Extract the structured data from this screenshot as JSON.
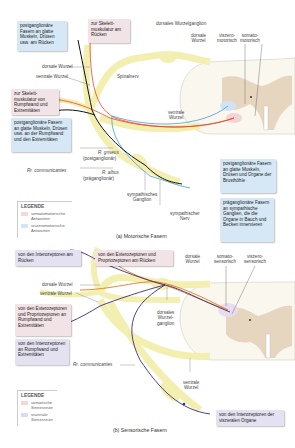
{
  "figure_a": {
    "caption": "(a) Motorische Fasern",
    "boxes": {
      "post_ruecken": "postganglionäre Fasern an glatte Muskeln, Drüsen usw. am Rücken",
      "skelett_ruecken": "zur Skelett-muskulatur am Rücken",
      "skelett_rumpf": "zur Skelett-muskulatur von Rumpfwand und Extremitäten",
      "post_rumpf": "postganglionäre Fasern an glatte Muskeln, Drüsen usw. an der Rumpfwand und den Extremitäten",
      "post_brust": "postganglionäre Fasern an glatte Muskeln, Drüsen und Organe der Brusthöhle",
      "prae_bauch": "präganglionäre Fasern an sympathische Ganglien, die die Organe in Bauch und Becken innervieren"
    },
    "labels": {
      "dorsales_ganglion": "dorsales Wurzelganglion",
      "dorsale_wurzel_top": "dorsale",
      "dorsale_wurzel_top2": "Wurzel",
      "viszero": "viszero-",
      "viszero2": "motorisch",
      "somato": "somato-",
      "somato2": "motorisch",
      "dorsale_wurzel": "dorsale Wurzel",
      "ventrale_wurzel": "ventrale Wurzel",
      "spinalnerv": "Spinalnerv",
      "ventrale_wurzel_r1": "ventrale",
      "ventrale_wurzel_r2": "Wurzel",
      "r_griseus": "R. griseus",
      "postganglionaer": "(postganglionär)",
      "r_albus": "R. albus",
      "praeganglionaer": "(präganglionär)",
      "rr_communicantes": "Rr. communicantes",
      "symp_ganglion1": "sympathisches",
      "symp_ganglion2": "Ganglion",
      "symp_nerv1": "sympathischer",
      "symp_nerv2": "Nerv"
    },
    "legend": {
      "title": "LEGENDE",
      "items": [
        {
          "label": "somatomotorische Antworten",
          "color": "#f4d7d9"
        },
        {
          "label": "viszeromotorische Antworten",
          "color": "#d3e6f4"
        }
      ]
    }
  },
  "figure_b": {
    "caption": "(b) Sensorische Fasern",
    "boxes": {
      "intero_ruecken": "von den Interozeptoren am Rücken",
      "extero_ruecken": "von den Exterozeptoren und Propriozeptoren am Rücken",
      "extero_rumpf": "von den Exterozeptoren und Propriozeptoren an Rumpfwand und Extremitäten",
      "intero_rumpf": "von den Interozeptoren an Rumpfwand und Extremitäten",
      "intero_organe": "von den Interozeptoren der viszeralen Organe"
    },
    "labels": {
      "dorsale_top1": "dorsale",
      "dorsale_top2": "Wurzel",
      "somato1": "somato-",
      "somato2": "sensorisch",
      "viszero1": "viszero-",
      "viszero2": "sensorisch",
      "dorsale_wurzel": "dorsale Wurzel",
      "ventrale_wurzel": "ventrale Wurzel",
      "dorsales_ganglion1": "dorsales",
      "dorsales_ganglion2": "Wurzel-",
      "dorsales_ganglion3": "ganglion",
      "rr_communicantes": "Rr. communicantes",
      "ventrale1": "ventrale",
      "ventrale2": "Wurzel"
    },
    "legend": {
      "title": "LEGENDE",
      "items": [
        {
          "label": "somatische Sinnesreize",
          "color": "#f4d7d9"
        },
        {
          "label": "viszerale Sinnesreize",
          "color": "#dcdcf0"
        }
      ]
    }
  },
  "colors": {
    "nerve": "#f3efb0",
    "nerve_stroke": "#d9d17a",
    "grey_matter": "#e6d6bf",
    "cord": "#faf7ef",
    "somatomotor": "#e8452a",
    "viszeromotor": "#4a9bd6",
    "post": "#111111",
    "sensory_somatic": "#e07a1e",
    "sensory_visceral": "#3a2f7a"
  }
}
